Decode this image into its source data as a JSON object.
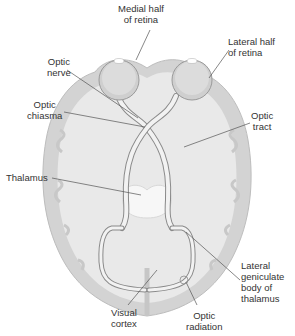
{
  "diagram": {
    "colors": {
      "background": "#ffffff",
      "cortex": "#d3d3d3",
      "brain_fill": "#e9e9e9",
      "thalamus": "#f7f7f7",
      "nerve": "#f2f2f2",
      "nerve_outline": "#8a8a8a",
      "eyeball": "#cfcfcf",
      "leader_line": "#555555",
      "text": "#333333"
    },
    "labels": {
      "medial_half": [
        "Medial half",
        "of retina"
      ],
      "lateral_half": [
        "Lateral half",
        "of retina"
      ],
      "optic_nerve": [
        "Optic",
        "nerve"
      ],
      "optic_chiasma": [
        "Optic",
        "chiasma"
      ],
      "optic_tract": [
        "Optic",
        "tract"
      ],
      "thalamus": [
        "Thalamus"
      ],
      "lateral_geniculate": [
        "Lateral",
        "geniculate",
        "body of",
        "thalamus"
      ],
      "visual_cortex": [
        "Visual",
        "cortex"
      ],
      "optic_radiation": [
        "Optic",
        "radiation"
      ]
    }
  }
}
